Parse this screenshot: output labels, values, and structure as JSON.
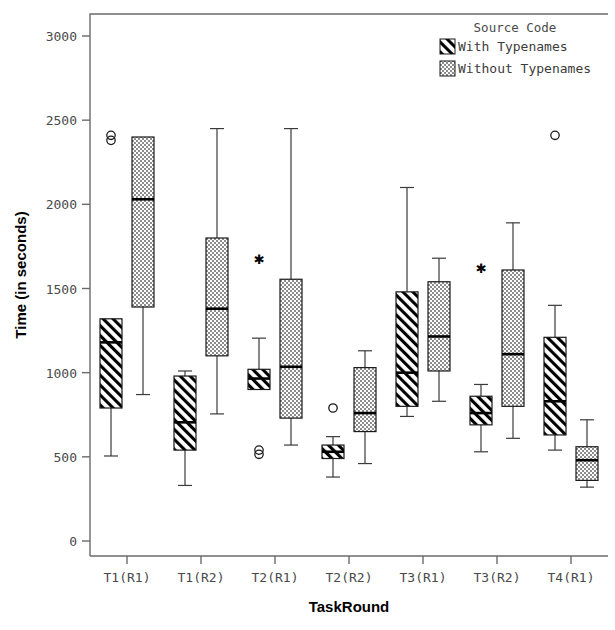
{
  "chart_data": {
    "type": "box",
    "title": "",
    "xlabel": "TaskRound",
    "ylabel": "Time (in seconds)",
    "ylim": [
      0,
      3150
    ],
    "yticks": [
      0,
      500,
      1000,
      1500,
      2000,
      2500,
      3000
    ],
    "ytick_labels": [
      "0",
      "500",
      "1000",
      "1500",
      "2000",
      "2500",
      "3000"
    ],
    "grid": false,
    "categories": [
      "T1(R1)",
      "T1(R2)",
      "T2(R1)",
      "T2(R2)",
      "T3(R1)",
      "T3(R2)",
      "T4(R1)"
    ],
    "legend": {
      "title": "Source Code",
      "position": "top-right",
      "entries": [
        {
          "label": "With Typenames",
          "pattern": "diagonal-hatch"
        },
        {
          "label": "Without Typenames",
          "pattern": "dotted-checker"
        }
      ]
    },
    "series": [
      {
        "name": "With Typenames",
        "pattern": "diagonal-hatch",
        "boxes": [
          {
            "category": "T1(R1)",
            "whisker_low": 505,
            "q1": 790,
            "median": 1180,
            "q3": 1320,
            "whisker_high": 1320,
            "outliers": [
              2380,
              2410
            ],
            "extremes": []
          },
          {
            "category": "T1(R2)",
            "whisker_low": 330,
            "q1": 540,
            "median": 705,
            "q3": 980,
            "whisker_high": 1010,
            "outliers": [],
            "extremes": []
          },
          {
            "category": "T2(R1)",
            "whisker_low": 900,
            "q1": 900,
            "median": 965,
            "q3": 1020,
            "whisker_high": 1205,
            "outliers": [
              515,
              540
            ],
            "extremes": [
              1680
            ]
          },
          {
            "category": "T2(R2)",
            "whisker_low": 380,
            "q1": 490,
            "median": 530,
            "q3": 570,
            "whisker_high": 620,
            "outliers": [
              790
            ],
            "extremes": []
          },
          {
            "category": "T3(R1)",
            "whisker_low": 740,
            "q1": 800,
            "median": 1000,
            "q3": 1480,
            "whisker_high": 2100,
            "outliers": [],
            "extremes": []
          },
          {
            "category": "T3(R2)",
            "whisker_low": 530,
            "q1": 690,
            "median": 760,
            "q3": 860,
            "whisker_high": 930,
            "outliers": [],
            "extremes": [
              1630
            ]
          },
          {
            "category": "T4(R1)",
            "whisker_low": 540,
            "q1": 630,
            "median": 830,
            "q3": 1210,
            "whisker_high": 1400,
            "outliers": [
              2410
            ],
            "extremes": []
          }
        ]
      },
      {
        "name": "Without Typenames",
        "pattern": "dotted-checker",
        "boxes": [
          {
            "category": "T1(R1)",
            "whisker_low": 870,
            "q1": 1390,
            "median": 2030,
            "q3": 2400,
            "whisker_high": 2400,
            "outliers": [],
            "extremes": []
          },
          {
            "category": "T1(R2)",
            "whisker_low": 755,
            "q1": 1100,
            "median": 1380,
            "q3": 1800,
            "whisker_high": 2450,
            "outliers": [],
            "extremes": []
          },
          {
            "category": "T2(R1)",
            "whisker_low": 570,
            "q1": 730,
            "median": 1035,
            "q3": 1555,
            "whisker_high": 2450,
            "outliers": [],
            "extremes": []
          },
          {
            "category": "T2(R2)",
            "whisker_low": 460,
            "q1": 650,
            "median": 760,
            "q3": 1030,
            "whisker_high": 1130,
            "outliers": [],
            "extremes": []
          },
          {
            "category": "T3(R1)",
            "whisker_low": 830,
            "q1": 1010,
            "median": 1215,
            "q3": 1540,
            "whisker_high": 1680,
            "outliers": [],
            "extremes": []
          },
          {
            "category": "T3(R2)",
            "whisker_low": 610,
            "q1": 800,
            "median": 1110,
            "q3": 1610,
            "whisker_high": 1890,
            "outliers": [],
            "extremes": []
          },
          {
            "category": "T4(R1)",
            "whisker_low": 320,
            "q1": 360,
            "median": 480,
            "q3": 560,
            "whisker_high": 720,
            "outliers": [],
            "extremes": []
          }
        ]
      }
    ]
  }
}
